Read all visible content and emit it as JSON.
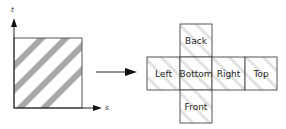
{
  "diagram": {
    "texture_square": {
      "axes": {
        "vertical_label": "t",
        "horizontal_label": "s"
      },
      "stripe_color": "#a8a8a8",
      "border_color": "#555555"
    },
    "arrow": {
      "direction": "right"
    },
    "cube_net": {
      "cells": [
        {
          "id": "back",
          "label": "Back"
        },
        {
          "id": "left",
          "label": "Left"
        },
        {
          "id": "bottom",
          "label": "Bottom"
        },
        {
          "id": "right",
          "label": "Right"
        },
        {
          "id": "top",
          "label": "Top"
        },
        {
          "id": "front",
          "label": "Front"
        }
      ],
      "stripe_color": "#d8d8d8",
      "border_color": "#555555"
    }
  }
}
